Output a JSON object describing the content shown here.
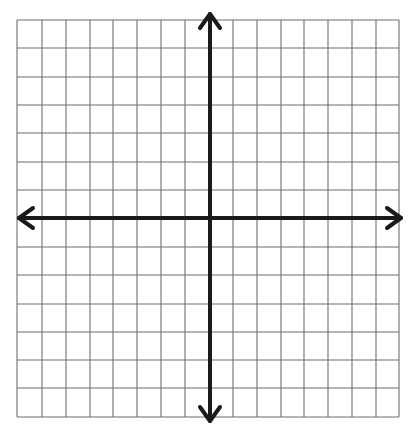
{
  "diagram": {
    "type": "coordinate-plane",
    "title": "",
    "grid": {
      "columns": 16,
      "rows": 14,
      "x_lines": [
        17,
        42,
        66,
        90,
        113,
        137,
        161,
        185,
        210,
        233,
        257,
        281,
        304,
        328,
        352,
        376,
        399
      ],
      "y_lines": [
        20,
        48,
        77,
        105,
        133,
        162,
        190,
        218,
        247,
        275,
        304,
        332,
        360,
        388,
        417
      ],
      "line_color": "#6e6e6e",
      "background": "#ffffff"
    },
    "axes": {
      "color": "#1a1a1a",
      "x_axis_y": 218,
      "y_axis_x": 210,
      "x_arrow_left": 19,
      "x_arrow_right": 401,
      "y_arrow_top": 14,
      "y_arrow_bottom": 421,
      "labels": []
    }
  }
}
